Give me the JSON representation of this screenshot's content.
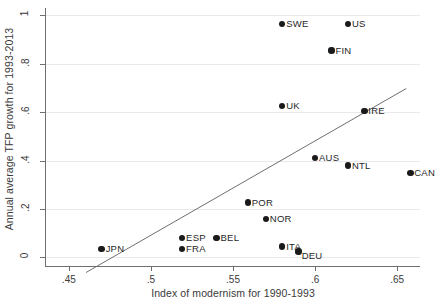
{
  "chart_data": {
    "type": "scatter",
    "title": "",
    "xlabel": "Index of modernism for 1990-1993",
    "ylabel": "Annual average TFP growth for 1993-2013",
    "xlim": [
      0.4361,
      0.6639
    ],
    "ylim": [
      -0.0352,
      1.0308
    ],
    "xticks": [
      ".45",
      ".5",
      ".55",
      ".6",
      ".65"
    ],
    "xtick_values": [
      0.45,
      0.5,
      0.55,
      0.6,
      0.65
    ],
    "yticks": [
      "0",
      ".2",
      ".4",
      ".6",
      ".8",
      "1"
    ],
    "ytick_values": [
      0,
      0.2,
      0.4,
      0.6,
      0.8,
      1
    ],
    "grid": "horizontal",
    "legend": "none",
    "marker_color": "#1a1a1a",
    "fitline_color": "#6f6f6f",
    "grid_color": "#e9e9ec",
    "axis_color": "#6f6f6f",
    "points": [
      {
        "label": "SWE",
        "x": 0.58,
        "y": 0.965,
        "label_pos": "right"
      },
      {
        "label": "US",
        "x": 0.62,
        "y": 0.965,
        "label_pos": "right"
      },
      {
        "label": "FIN",
        "x": 0.61,
        "y": 0.855,
        "label_pos": "right"
      },
      {
        "label": "UK",
        "x": 0.58,
        "y": 0.625,
        "label_pos": "right"
      },
      {
        "label": "IRE",
        "x": 0.63,
        "y": 0.605,
        "label_pos": "right"
      },
      {
        "label": "AUS",
        "x": 0.6,
        "y": 0.412,
        "label_pos": "right"
      },
      {
        "label": "NTL",
        "x": 0.62,
        "y": 0.38,
        "label_pos": "right"
      },
      {
        "label": "CAN",
        "x": 0.658,
        "y": 0.35,
        "label_pos": "right"
      },
      {
        "label": "POR",
        "x": 0.559,
        "y": 0.227,
        "label_pos": "right"
      },
      {
        "label": "NOR",
        "x": 0.57,
        "y": 0.16,
        "label_pos": "right"
      },
      {
        "label": "ESP",
        "x": 0.519,
        "y": 0.08,
        "label_pos": "right"
      },
      {
        "label": "BEL",
        "x": 0.54,
        "y": 0.08,
        "label_pos": "right"
      },
      {
        "label": "FRA",
        "x": 0.519,
        "y": 0.035,
        "label_pos": "right"
      },
      {
        "label": "ITA",
        "x": 0.58,
        "y": 0.045,
        "label_pos": "right"
      },
      {
        "label": "DEU",
        "x": 0.59,
        "y": 0.025,
        "label_pos": "below"
      },
      {
        "label": "JPN",
        "x": 0.47,
        "y": 0.035,
        "label_pos": "right"
      }
    ],
    "fit_line": {
      "name": "linear fit",
      "x1": 0.4605,
      "y1": -0.062,
      "x2": 0.6555,
      "y2": 0.698
    }
  }
}
